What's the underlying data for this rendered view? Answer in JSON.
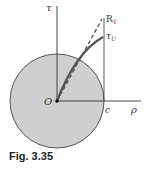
{
  "figure": {
    "caption": "Fig. 3.35",
    "labels": {
      "tau_axis": "τ",
      "rho_axis": "ρ",
      "origin": "O",
      "c_point": "c",
      "R_T": "R",
      "R_T_sub": "T",
      "tau_U": "τ",
      "tau_U_sub": "U"
    },
    "colors": {
      "disk_fill": "#cfcfcf",
      "lines": "#444444",
      "curve": "#555555"
    }
  }
}
